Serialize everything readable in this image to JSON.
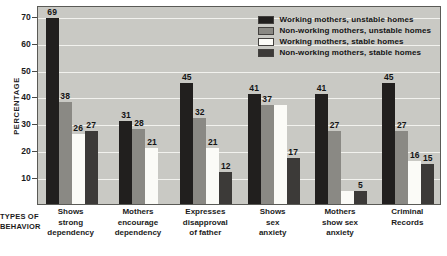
{
  "chart_data": {
    "type": "bar",
    "title": "",
    "xlabel": "TYPES OF BEHAVIOR",
    "ylabel": "PERCENTAGE",
    "ylim": [
      0,
      74
    ],
    "yticks": [
      10,
      20,
      30,
      40,
      50,
      60,
      70
    ],
    "grid": true,
    "legend_position": "top-right-inside",
    "categories": [
      "Shows strong dependency",
      "Mothers encourage dependency",
      "Expresses disapproval of father",
      "Shows sex anxiety",
      "Mothers show sex anxiety",
      "Criminal Records"
    ],
    "category_lines": [
      [
        "Shows",
        "strong",
        "dependency"
      ],
      [
        "Mothers",
        "encourage",
        "dependency"
      ],
      [
        "Expresses",
        "disapproval",
        "of father"
      ],
      [
        "Shows",
        "sex",
        "anxiety"
      ],
      [
        "Mothers",
        "show sex",
        "anxiety"
      ],
      [
        "Criminal",
        "Records"
      ]
    ],
    "series": [
      {
        "name": "Working mothers, unstable homes",
        "color": "#211f1e",
        "values": [
          69,
          31,
          45,
          41,
          41,
          45
        ],
        "labels": [
          "69",
          "31",
          "45",
          "41",
          "41",
          "45"
        ]
      },
      {
        "name": "Non-working mothers, unstable homes",
        "color": "#8a8984",
        "values": [
          38,
          28,
          32,
          37,
          27,
          27
        ],
        "labels": [
          "38",
          "28",
          "32",
          "37",
          "27",
          "27"
        ]
      },
      {
        "name": "Working mothers, stable homes",
        "color": "#fbfbf7",
        "values": [
          26,
          21,
          21,
          37,
          5,
          16
        ],
        "labels": [
          "26",
          "21",
          "21",
          "",
          "",
          "16"
        ]
      },
      {
        "name": "Non-working mothers, stable homes",
        "color": "#3c3a38",
        "values": [
          27,
          null,
          12,
          17,
          5,
          15
        ],
        "labels": [
          "27",
          "",
          "12",
          "17",
          "5",
          "15"
        ]
      }
    ]
  },
  "legend": {
    "items": [
      {
        "label": "Working mothers, unstable homes",
        "swatch": "s0"
      },
      {
        "label": "Non-working mothers, unstable homes",
        "swatch": "s1"
      },
      {
        "label": "Working mothers, stable homes",
        "swatch": "s2"
      },
      {
        "label": "Non-working mothers, stable homes",
        "swatch": "s3"
      }
    ]
  },
  "axes": {
    "y_title": "PERCENTAGE",
    "x_title_lines": [
      "TYPES OF",
      "BEHAVIOR"
    ],
    "y_tick_labels": [
      "70",
      "60",
      "50",
      "40",
      "30",
      "20",
      "10"
    ]
  }
}
